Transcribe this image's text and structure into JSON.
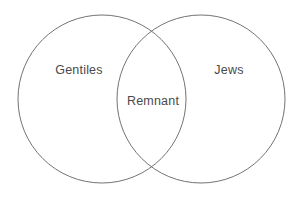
{
  "figure": {
    "type": "venn-diagram-2-set",
    "background_color": "#ffffff",
    "stroke_color": "#737373",
    "text_color": "#4a4a4a",
    "stroke_width": 1
  },
  "sets": {
    "left": {
      "label": "Gentiles",
      "center_x": 102,
      "center_y": 99,
      "radius": 84
    },
    "right": {
      "label": "Jews",
      "center_x": 201,
      "center_y": 99,
      "radius": 84
    },
    "intersection": {
      "label": "Remnant",
      "center_x": 153,
      "center_y": 101
    }
  }
}
